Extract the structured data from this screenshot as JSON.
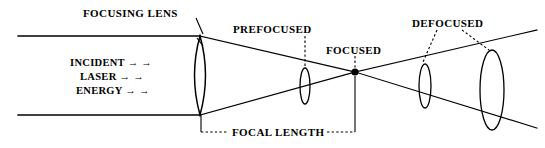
{
  "figure": {
    "background_color": "#ffffff",
    "ink_color": "#000000",
    "width": 545,
    "height": 148
  },
  "labels": {
    "focusing_lens": "FOCUSING LENS",
    "prefocused": "PREFOCUSED",
    "focused": "FOCUSED",
    "defocused": "DEFOCUSED",
    "focal_length": "FOCAL LENGTH",
    "incident": "INCIDENT → →",
    "laser": "LASER → →",
    "energy": "ENERGY → →"
  },
  "beam": {
    "incident_top_y": 36,
    "incident_bottom_y": 115,
    "lens_x": 200,
    "focal_point_x": 355,
    "focal_point_y": 72
  },
  "spots": [
    {
      "name": "prefocused-spot",
      "x": 305,
      "y": 86,
      "rx": 5,
      "ry": 18
    },
    {
      "name": "focused-point",
      "x": 355,
      "y": 72,
      "r": 3.6
    },
    {
      "name": "defocused-spot-near",
      "x": 425,
      "y": 86,
      "rx": 6,
      "ry": 22
    },
    {
      "name": "defocused-spot-far",
      "x": 492,
      "y": 90,
      "rx": 12,
      "ry": 40
    }
  ],
  "lens": {
    "name": "focusing-lens",
    "x": 200,
    "top_y": 36,
    "bottom_y": 115,
    "half_width": 11
  }
}
